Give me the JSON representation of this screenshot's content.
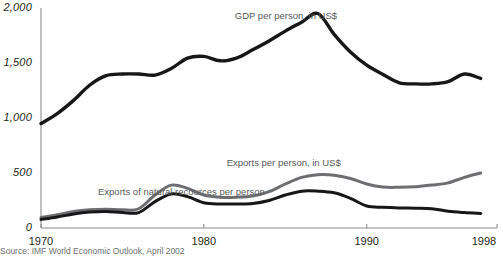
{
  "chart_data": {
    "type": "line",
    "title": "",
    "subtitle": "",
    "xlabel": "",
    "ylabel": "",
    "xlim": [
      1970,
      1998
    ],
    "ylim": [
      0,
      2000
    ],
    "grid": false,
    "legend_position": "inline-annotations",
    "x_ticks": [
      "1970",
      "1980",
      "1990",
      "1998"
    ],
    "x_tick_values": [
      1970,
      1980,
      1990,
      1998
    ],
    "y_ticks": [
      "0",
      "500",
      "1,000",
      "1,500",
      "2,000"
    ],
    "y_tick_values": [
      0,
      500,
      1000,
      1500,
      2000
    ],
    "source": "Source: IMF World Economic Outlook, April 2002",
    "x": [
      1970,
      1971,
      1972,
      1973,
      1974,
      1975,
      1976,
      1977,
      1978,
      1979,
      1980,
      1981,
      1982,
      1983,
      1984,
      1985,
      1986,
      1987,
      1988,
      1989,
      1990,
      1991,
      1992,
      1993,
      1994,
      1995,
      1996,
      1997
    ],
    "series": [
      {
        "name": "GDP per person, in US$",
        "label": "GDP per person, in US$",
        "color": "#171717",
        "width": 3.4,
        "label_x": 1981.9,
        "label_y": 1925,
        "values": [
          950,
          1040,
          1160,
          1300,
          1385,
          1400,
          1400,
          1390,
          1450,
          1545,
          1560,
          1520,
          1545,
          1620,
          1700,
          1790,
          1870,
          1950,
          1760,
          1600,
          1480,
          1395,
          1320,
          1310,
          1310,
          1330,
          1400,
          1360
        ]
      },
      {
        "name": "Exports per person, in US$",
        "label": "Exports per person, in US$",
        "color": "#6d6e71",
        "width": 3.0,
        "label_x": 1981.4,
        "label_y": 588,
        "values": [
          95,
          120,
          150,
          165,
          170,
          165,
          175,
          300,
          390,
          360,
          300,
          280,
          280,
          290,
          330,
          400,
          460,
          485,
          480,
          450,
          400,
          372,
          370,
          375,
          390,
          410,
          460,
          500
        ]
      },
      {
        "name": "Exports of natural recources per person",
        "label": "Exports of natural recources per person",
        "color": "#171717",
        "width": 3.0,
        "label_x": 1973.5,
        "label_y": 330,
        "values": [
          78,
          100,
          128,
          145,
          150,
          140,
          140,
          240,
          310,
          285,
          230,
          218,
          218,
          222,
          250,
          300,
          335,
          335,
          320,
          270,
          200,
          188,
          182,
          180,
          175,
          152,
          140,
          132
        ]
      }
    ]
  }
}
